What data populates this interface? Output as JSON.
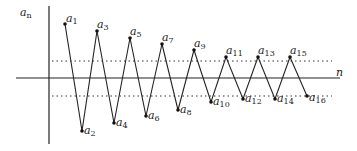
{
  "axes": {
    "y_label": "a",
    "y_label_sub": "n",
    "x_label": "n",
    "origin": {
      "x": 49,
      "y": 78
    },
    "x_axis": {
      "x1": 16,
      "x2": 340
    },
    "y_axis": {
      "y1": 6,
      "y2": 144
    }
  },
  "bounds": {
    "upper": {
      "y": 61,
      "x1": 52,
      "x2": 332
    },
    "lower": {
      "y": 96,
      "x1": 52,
      "x2": 332
    }
  },
  "points": [
    {
      "name": "a",
      "sub": "1",
      "x": 65,
      "y": 24,
      "lx": 66,
      "ly": 22
    },
    {
      "name": "a",
      "sub": "2",
      "x": 82,
      "y": 131,
      "lx": 84,
      "ly": 134
    },
    {
      "name": "a",
      "sub": "3",
      "x": 97,
      "y": 31,
      "lx": 97,
      "ly": 28
    },
    {
      "name": "a",
      "sub": "4",
      "x": 114,
      "y": 123,
      "lx": 116,
      "ly": 126
    },
    {
      "name": "a",
      "sub": "5",
      "x": 130,
      "y": 38,
      "lx": 130,
      "ly": 35
    },
    {
      "name": "a",
      "sub": "6",
      "x": 146,
      "y": 116,
      "lx": 148,
      "ly": 119
    },
    {
      "name": "a",
      "sub": "7",
      "x": 162,
      "y": 44,
      "lx": 162,
      "ly": 41
    },
    {
      "name": "a",
      "sub": "8",
      "x": 178,
      "y": 110,
      "lx": 180,
      "ly": 113
    },
    {
      "name": "a",
      "sub": "9",
      "x": 194,
      "y": 50,
      "lx": 194,
      "ly": 47
    },
    {
      "name": "a",
      "sub": "10",
      "x": 211,
      "y": 102,
      "lx": 213,
      "ly": 105
    },
    {
      "name": "a",
      "sub": "11",
      "x": 226,
      "y": 57,
      "lx": 226,
      "ly": 54
    },
    {
      "name": "a",
      "sub": "12",
      "x": 243,
      "y": 99,
      "lx": 245,
      "ly": 102
    },
    {
      "name": "a",
      "sub": "13",
      "x": 258,
      "y": 57,
      "lx": 258,
      "ly": 54
    },
    {
      "name": "a",
      "sub": "14",
      "x": 275,
      "y": 99,
      "lx": 277,
      "ly": 102
    },
    {
      "name": "a",
      "sub": "15",
      "x": 290,
      "y": 57,
      "lx": 290,
      "ly": 54
    },
    {
      "name": "a",
      "sub": "16",
      "x": 307,
      "y": 96,
      "lx": 309,
      "ly": 101
    }
  ],
  "colors": {
    "line": "#222222",
    "dotted": "#333333"
  }
}
